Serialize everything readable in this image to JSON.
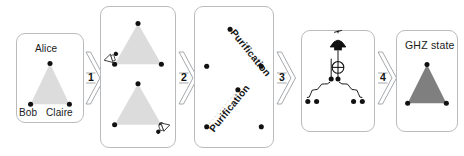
{
  "figure": {
    "background": "#ffffff",
    "panel_border_color": "#b9bcbf",
    "triangle_light_fill": "#dcdcdc",
    "triangle_dark_fill": "#7f7f7f",
    "node_color": "#111111",
    "dotted_line_color": "#c9c9c9"
  },
  "panels": [
    {
      "id": "panel-parties",
      "title": "",
      "nodes": [
        {
          "name": "alice",
          "label": "Alice"
        },
        {
          "name": "bob",
          "label": "Bob"
        },
        {
          "name": "claire",
          "label": "Claire"
        }
      ]
    },
    {
      "id": "panel-bell-pairs",
      "title": "",
      "icons": [
        {
          "name": "detector-icon-upper"
        },
        {
          "name": "detector-icon-lower"
        }
      ]
    },
    {
      "id": "panel-purification",
      "title": "",
      "labels": [
        {
          "name": "purification-label-upper",
          "text": "Purification"
        },
        {
          "name": "purification-label-lower",
          "text": "Purification"
        }
      ]
    },
    {
      "id": "panel-fusion-circuit",
      "title": "",
      "icons": [
        {
          "name": "detector-icon",
          "label": ""
        },
        {
          "name": "cnot-target-icon",
          "label": ""
        }
      ]
    },
    {
      "id": "panel-ghz-state",
      "title": "GHZ state",
      "nodes": []
    }
  ],
  "arrows": [
    {
      "name": "arrow-step-1",
      "number": "1"
    },
    {
      "name": "arrow-step-2",
      "number": "2"
    },
    {
      "name": "arrow-step-3",
      "number": "3"
    },
    {
      "name": "arrow-step-4",
      "number": "4"
    }
  ]
}
